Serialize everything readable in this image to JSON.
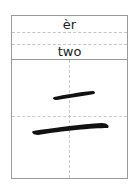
{
  "card": {
    "pinyin": "èr",
    "meaning": "two",
    "character": "二",
    "strokes": 2
  },
  "colors": {
    "border": "#9a9a9a",
    "guide": "#c8c8c8",
    "ink": "#111111"
  }
}
